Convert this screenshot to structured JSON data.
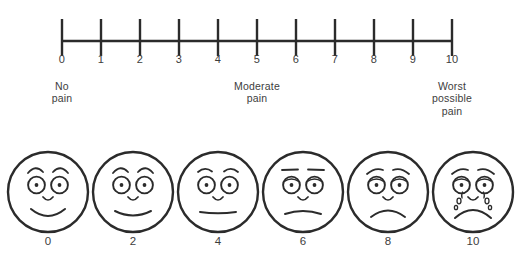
{
  "colors": {
    "background": "#ffffff",
    "line": "#2b2b2b",
    "text": "#3d3d3d",
    "face_stroke": "#2b2b2b"
  },
  "scale": {
    "type": "number-line",
    "min": 0,
    "max": 10,
    "ticks": [
      {
        "value": 0,
        "label": "0"
      },
      {
        "value": 1,
        "label": "1"
      },
      {
        "value": 2,
        "label": "2"
      },
      {
        "value": 3,
        "label": "3"
      },
      {
        "value": 4,
        "label": "4"
      },
      {
        "value": 5,
        "label": "5"
      },
      {
        "value": 6,
        "label": "6"
      },
      {
        "value": 7,
        "label": "7"
      },
      {
        "value": 8,
        "label": "8"
      },
      {
        "value": 9,
        "label": "9"
      },
      {
        "value": 10,
        "label": "10"
      }
    ],
    "anchors": [
      {
        "id": "no-pain",
        "at": 0,
        "lines": [
          "No",
          "pain"
        ]
      },
      {
        "id": "moderate-pain",
        "at": 5,
        "lines": [
          "Moderate",
          "pain"
        ]
      },
      {
        "id": "worst-possible-pain",
        "at": 10,
        "lines": [
          "Worst",
          "possible",
          "pain"
        ]
      }
    ]
  },
  "faces": [
    {
      "id": "face-0",
      "value": 0,
      "label": "0",
      "expression": "broad-smile",
      "brows": "arched",
      "mouth": "big-smile",
      "tears": false
    },
    {
      "id": "face-2",
      "value": 2,
      "label": "2",
      "expression": "slight-smile",
      "brows": "arched",
      "mouth": "smile",
      "tears": false
    },
    {
      "id": "face-4",
      "value": 4,
      "label": "4",
      "expression": "neutral",
      "brows": "low-arched",
      "mouth": "flat",
      "tears": false
    },
    {
      "id": "face-6",
      "value": 6,
      "label": "6",
      "expression": "uncomfortable",
      "brows": "straight",
      "mouth": "slight-frown",
      "tears": false
    },
    {
      "id": "face-8",
      "value": 8,
      "label": "8",
      "expression": "distressed",
      "brows": "worried",
      "mouth": "frown",
      "tears": false
    },
    {
      "id": "face-10",
      "value": 10,
      "label": "10",
      "expression": "crying",
      "brows": "worried",
      "mouth": "deep-frown",
      "tears": true
    }
  ],
  "chart_data": {
    "type": "table",
    "xlabel": "Pain intensity",
    "ylabel": "",
    "x": [
      0,
      1,
      2,
      3,
      4,
      5,
      6,
      7,
      8,
      9,
      10
    ],
    "categories": [
      "0",
      "1",
      "2",
      "3",
      "4",
      "5",
      "6",
      "7",
      "8",
      "9",
      "10"
    ],
    "values": [
      0,
      1,
      2,
      3,
      4,
      5,
      6,
      7,
      8,
      9,
      10
    ],
    "xlim": [
      0,
      10
    ],
    "grid": false,
    "legend": "none",
    "annotations": [
      "No pain",
      "Moderate pain",
      "Worst possible pain"
    ],
    "face_values": [
      0,
      2,
      4,
      6,
      8,
      10
    ],
    "face_expressions": [
      "broad-smile",
      "slight-smile",
      "neutral",
      "uncomfortable",
      "distressed",
      "crying"
    ]
  }
}
